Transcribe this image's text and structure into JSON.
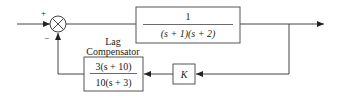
{
  "diagram": {
    "type": "feedback-control-block-diagram",
    "summing_junction": {
      "plus_sign": "+",
      "minus_sign": "−"
    },
    "plant": {
      "numerator": "1",
      "denominator": "(s + 1)(s + 2)"
    },
    "gain": {
      "label": "K"
    },
    "compensator": {
      "title_line1": "Lag",
      "title_line2": "Compensator",
      "numerator": "3(s + 10)",
      "denominator": "10(s + 3)"
    },
    "colors": {
      "line": "#444444",
      "text": "#222222",
      "background": "#ffffff"
    }
  }
}
